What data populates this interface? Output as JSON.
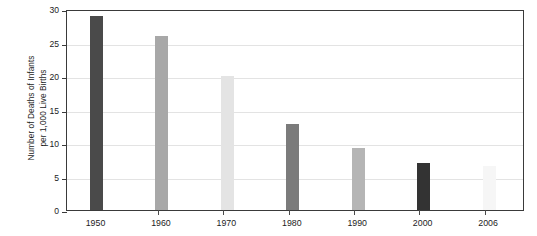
{
  "chart_data": {
    "type": "bar",
    "title": "",
    "xlabel": "",
    "ylabel_line1": "Number of Deaths of Infants",
    "ylabel_line2": "per 1,000 Live Births",
    "categories": [
      "1950",
      "1960",
      "1970",
      "1980",
      "1990",
      "2000",
      "2006"
    ],
    "values": [
      29,
      26,
      20,
      12.8,
      9.2,
      7.0,
      6.5
    ],
    "bar_colors": [
      "#4a4a4a",
      "#a8a8a8",
      "#e4e4e4",
      "#7b7b7b",
      "#b5b5b5",
      "#333333",
      "#f6f6f6"
    ],
    "ylim": [
      0,
      30
    ],
    "ytick_labels": [
      "0",
      "5",
      "10",
      "15",
      "20",
      "25",
      "30"
    ],
    "ytick_values": [
      0,
      5,
      10,
      15,
      20,
      25,
      30
    ],
    "grid": true,
    "grid_axis": "y",
    "legend": null,
    "legend_position": "none",
    "frame_color": "#3a3a3a",
    "gridline_color": "#e3e3e3",
    "background_color": "#ffffff"
  }
}
